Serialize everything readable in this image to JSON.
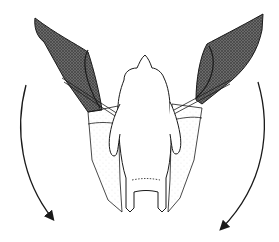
{
  "diagram": {
    "view": "dorsal",
    "motion": "wing downstroke",
    "arrows": [
      {
        "side": "left",
        "direction": "down"
      },
      {
        "side": "right",
        "direction": "down"
      }
    ],
    "colors": {
      "background": "#ffffff",
      "line": "#1a1a1a",
      "wing_shade": "#5a5a5a",
      "membrane_stipple": "#9a9a9a"
    }
  }
}
